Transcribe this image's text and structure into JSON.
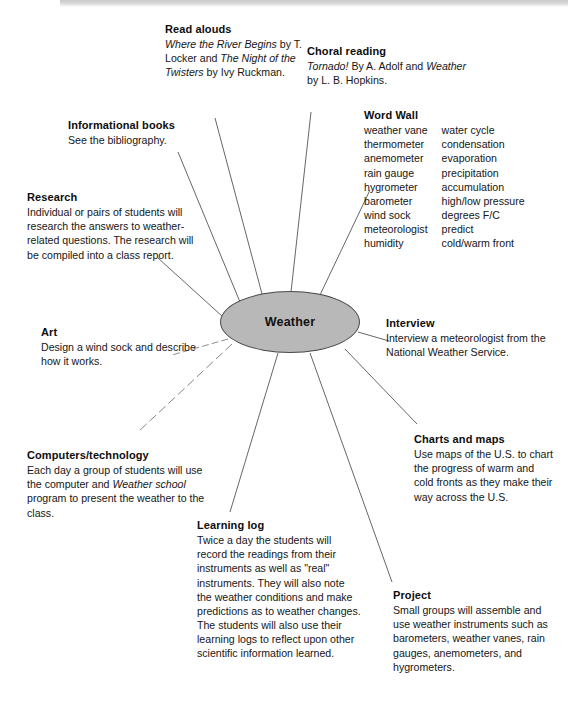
{
  "diagram": {
    "hub": {
      "label": "Weather",
      "fill": "#b8b8b8",
      "stroke": "#4a4a4a"
    },
    "line_color": "#555555",
    "nodes": [
      {
        "id": "read-alouds",
        "title": "Read alouds",
        "body": "Where the River Begins by T. Locker and The Night of the Twisters by Ivy Ruckman."
      },
      {
        "id": "choral-reading",
        "title": "Choral reading",
        "body": "Tornado! By A. Adolf and Weather by L. B. Hopkins."
      },
      {
        "id": "word-wall",
        "title": "Word Wall",
        "column_left": [
          "weather vane",
          "thermometer",
          "anemometer",
          "rain gauge",
          "hygrometer",
          "barometer",
          "wind sock",
          "meteorologist",
          "humidity"
        ],
        "column_right": [
          "water cycle",
          "condensation",
          "evaporation",
          "precipitation",
          "accumulation",
          "high/low pressure",
          "degrees F/C",
          "predict",
          "cold/warm front"
        ]
      },
      {
        "id": "informational-books",
        "title": "Informational books",
        "body": "See the bibliography."
      },
      {
        "id": "research",
        "title": "Research",
        "body": "Individual or pairs of students will research the answers to weather-related questions. The research will be compiled into a class report."
      },
      {
        "id": "art",
        "title": "Art",
        "body": "Design a wind sock and describe how it works."
      },
      {
        "id": "interview",
        "title": "Interview",
        "body": "Interview a meteorologist from the National Weather Service."
      },
      {
        "id": "computers-technology",
        "title": "Computers/technology",
        "body": "Each day a group of students will use the computer and Weather school program to present the weather to the class."
      },
      {
        "id": "charts-and-maps",
        "title": "Charts and maps",
        "body": "Use maps of the U.S. to chart the progress of warm and cold fronts as they make their way across the U.S."
      },
      {
        "id": "learning-log",
        "title": "Learning log",
        "body": "Twice a day the students will record the readings from their instruments as well as \"real\" instruments. They will also note the weather conditions and make predictions as to weather changes. The students will also use their learning logs to reflect upon other scientific information learned."
      },
      {
        "id": "project",
        "title": "Project",
        "body": "Small groups will assemble and use weather instruments such as barometers, weather vanes, rain gauges, anemometers, and hygrometers."
      }
    ]
  }
}
